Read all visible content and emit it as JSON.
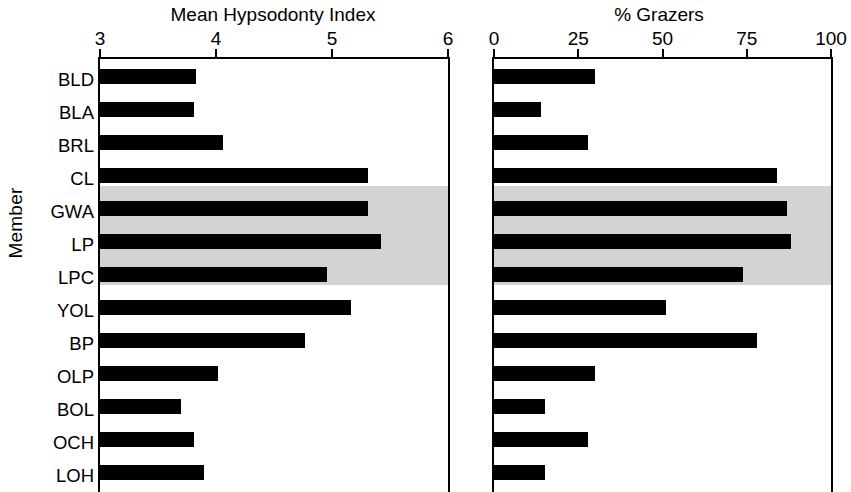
{
  "figure": {
    "y_axis_title": "Member",
    "members": [
      "BLD",
      "BLA",
      "BRL",
      "CL",
      "GWA",
      "LP",
      "LPC",
      "YOL",
      "BP",
      "OLP",
      "BOL",
      "OCH",
      "LOH"
    ],
    "highlight_members": [
      "GWA",
      "LP",
      "LPC"
    ],
    "highlight_color": "#d3d3d3",
    "bar_color": "#000000",
    "axis_color": "#000000",
    "background_color": "#ffffff"
  },
  "chart_data": [
    {
      "type": "bar",
      "orientation": "horizontal",
      "title": "Mean Hypsodonty Index",
      "xlabel": "Mean Hypsodonty Index",
      "ylabel": "Member",
      "xlim": [
        3,
        6
      ],
      "xticks": [
        3,
        4,
        5,
        6
      ],
      "xtick_labels": [
        "3",
        "4",
        "5",
        "6"
      ],
      "grid": false,
      "legend": "none",
      "categories": [
        "BLD",
        "BLA",
        "BRL",
        "CL",
        "GWA",
        "LP",
        "LPC",
        "YOL",
        "BP",
        "OLP",
        "BOL",
        "OCH",
        "LOH"
      ],
      "values": [
        3.83,
        3.81,
        4.06,
        5.31,
        5.31,
        5.42,
        4.96,
        5.16,
        4.77,
        4.02,
        3.7,
        3.81,
        3.9
      ]
    },
    {
      "type": "bar",
      "orientation": "horizontal",
      "title": "% Grazers",
      "xlabel": "% Grazers",
      "ylabel": "Member",
      "xlim": [
        0,
        100
      ],
      "xticks": [
        0,
        25,
        50,
        75,
        100
      ],
      "xtick_labels": [
        "0",
        "25",
        "50",
        "75",
        "100"
      ],
      "grid": false,
      "legend": "none",
      "categories": [
        "BLD",
        "BLA",
        "BRL",
        "CL",
        "GWA",
        "LP",
        "LPC",
        "YOL",
        "BP",
        "OLP",
        "BOL",
        "OCH",
        "LOH"
      ],
      "values": [
        30,
        14,
        28,
        84,
        87,
        88,
        74,
        51,
        78,
        30,
        15,
        28,
        15
      ]
    }
  ]
}
